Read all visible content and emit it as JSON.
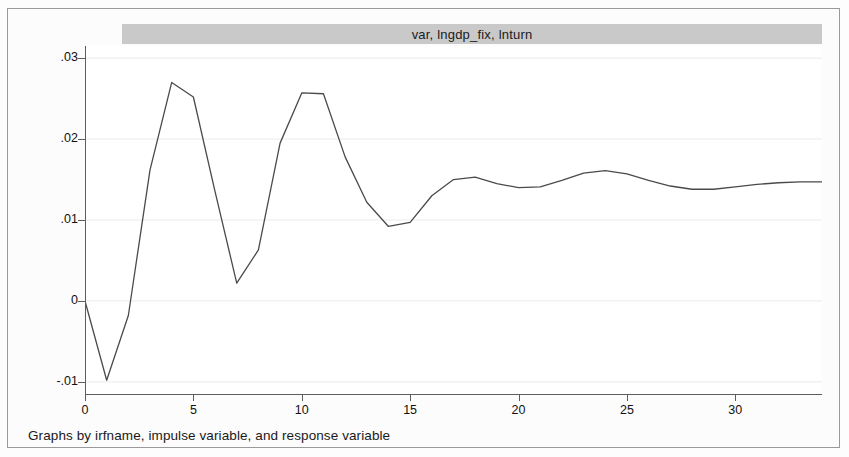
{
  "figure": {
    "title": "var, lngdp_fix, lnturn",
    "caption": "Graphs by irfname, impulse variable, and response variable",
    "line_color": "#4a4a4a",
    "title_band_color": "#c9c9c9",
    "grid_color": "#ebebeb"
  },
  "axes": {
    "y_ticks": [
      {
        "label": ".03",
        "value": 0.03
      },
      {
        "label": ".02",
        "value": 0.02
      },
      {
        "label": ".01",
        "value": 0.01
      },
      {
        "label": "0",
        "value": 0
      },
      {
        "label": "-.01",
        "value": -0.01
      }
    ],
    "x_ticks": [
      {
        "label": "0",
        "value": 0
      },
      {
        "label": "5",
        "value": 5
      },
      {
        "label": "10",
        "value": 10
      },
      {
        "label": "15",
        "value": 15
      },
      {
        "label": "20",
        "value": 20
      },
      {
        "label": "25",
        "value": 25
      },
      {
        "label": "30",
        "value": 30
      }
    ]
  },
  "chart_data": {
    "type": "line",
    "title": "var, lngdp_fix, lnturn",
    "subtitle": "",
    "xlabel": "",
    "ylabel": "",
    "xlim": [
      0,
      34
    ],
    "ylim": [
      -0.0115,
      0.0315
    ],
    "grid": true,
    "legend_position": "none",
    "annotations": [
      "Graphs by irfname, impulse variable, and response variable"
    ],
    "x": [
      0,
      1,
      2,
      3,
      4,
      5,
      6,
      7,
      8,
      9,
      10,
      11,
      12,
      13,
      14,
      15,
      16,
      17,
      18,
      19,
      20,
      21,
      22,
      23,
      24,
      25,
      26,
      27,
      28,
      29,
      30,
      31,
      32,
      33,
      34
    ],
    "series": [
      {
        "name": "lnturn response to lngdp_fix",
        "values": [
          0.0,
          -0.0098,
          -0.0018,
          0.0162,
          0.027,
          0.0252,
          0.0135,
          0.0022,
          0.0063,
          0.0195,
          0.0257,
          0.0256,
          0.0178,
          0.0122,
          0.0092,
          0.0097,
          0.013,
          0.015,
          0.0153,
          0.0145,
          0.014,
          0.0141,
          0.0149,
          0.0158,
          0.0161,
          0.0157,
          0.0149,
          0.0142,
          0.0138,
          0.0138,
          0.0141,
          0.0144,
          0.0146,
          0.0147,
          0.0147
        ]
      }
    ]
  }
}
